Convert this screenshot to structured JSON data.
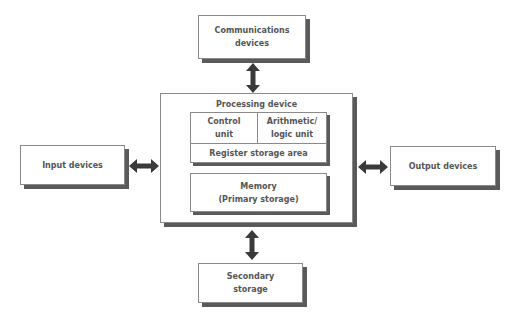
{
  "diagram": {
    "colors": {
      "box_border": "#8a8a8a",
      "box_shadow": "#5a5a5a",
      "text": "#555555",
      "arrow": "#3a3a3a"
    },
    "nodes": {
      "communications": {
        "label": "Communications\ndevices"
      },
      "processing": {
        "label": "Processing device",
        "cpu": {
          "control_unit": "Control\nunit",
          "alu": "Arithmetic/\nlogic unit",
          "registers": "Register storage area"
        },
        "memory": "Memory\n(Primary storage)"
      },
      "input": {
        "label": "Input devices"
      },
      "output": {
        "label": "Output devices"
      },
      "secondary": {
        "label": "Secondary\nstorage"
      }
    },
    "edges": [
      {
        "from": "communications",
        "to": "processing",
        "type": "bidirectional"
      },
      {
        "from": "input",
        "to": "processing",
        "type": "bidirectional"
      },
      {
        "from": "processing",
        "to": "output",
        "type": "bidirectional"
      },
      {
        "from": "processing",
        "to": "secondary",
        "type": "bidirectional"
      }
    ]
  }
}
